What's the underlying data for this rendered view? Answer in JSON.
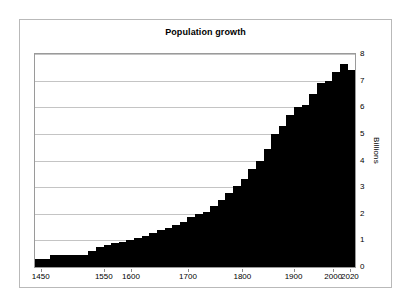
{
  "figure": {
    "title": "Population growth",
    "background_color": "#ffffff",
    "border_color": "#b9b9b9",
    "series_color": "#000000",
    "gridline_color": "#c4c4c4"
  },
  "axes": {
    "y_title": "Billions",
    "y_ticks": [
      "0",
      "1",
      "2",
      "3",
      "4",
      "5",
      "6",
      "7",
      "8"
    ],
    "y_position": "right",
    "x_ticks": [
      "1450",
      "1550",
      "1600",
      "1700",
      "1800",
      "1900",
      "2000",
      "2020"
    ]
  },
  "chart_data": {
    "type": "bar",
    "title": "Population growth",
    "xlabel": "",
    "ylabel": "Billions",
    "ylim": [
      0,
      8
    ],
    "yticks": [
      0,
      1,
      2,
      3,
      4,
      5,
      6,
      7,
      8
    ],
    "grid": true,
    "legend": "none",
    "xtick_labels": [
      "1450",
      "1550",
      "1600",
      "1700",
      "1800",
      "1900",
      "2000",
      "2020"
    ],
    "xtick_positions_frac": [
      0.018,
      0.215,
      0.3,
      0.478,
      0.648,
      0.808,
      0.932,
      0.984
    ],
    "categories": [
      "1450",
      "1500",
      "1550",
      "1600",
      "1650",
      "1700",
      "1720",
      "1740",
      "1760",
      "1780",
      "1800",
      "1820",
      "1840",
      "1850",
      "1860",
      "1870",
      "1880",
      "1890",
      "1900",
      "1910",
      "1920",
      "1927",
      "1930",
      "1940",
      "1950",
      "1955",
      "1960",
      "1965",
      "1970",
      "1974",
      "1980",
      "1987",
      "1990",
      "1995",
      "1999",
      "2000",
      "2005",
      "2010",
      "2011",
      "2015",
      "2018",
      "2020"
    ],
    "values": [
      0.3,
      0.3,
      0.44,
      0.44,
      0.45,
      0.45,
      0.47,
      0.61,
      0.77,
      0.82,
      0.89,
      0.95,
      1.02,
      1.09,
      1.18,
      1.27,
      1.38,
      1.47,
      1.57,
      1.7,
      1.86,
      2.0,
      2.07,
      2.3,
      2.52,
      2.77,
      3.03,
      3.32,
      3.7,
      4.0,
      4.43,
      5.0,
      5.28,
      5.7,
      6.0,
      6.09,
      6.49,
      6.92,
      7.0,
      7.34,
      7.63,
      7.4
    ],
    "peak_value": 7.4,
    "min_value": 0.3
  }
}
